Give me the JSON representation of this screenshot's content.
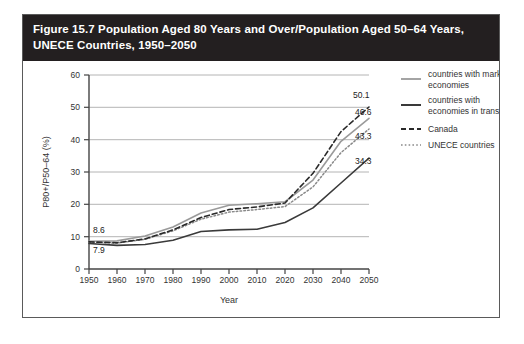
{
  "figure": {
    "title_line1": "Figure 15.7 Population Aged 80 Years and Over/Population Aged 50–64 Years,",
    "title_line2": "UNECE Countries, 1950–2050",
    "title_bg": "#231f20",
    "title_color": "#ffffff",
    "border_color": "#5a5a5a"
  },
  "chart_data": {
    "type": "line",
    "title": "Figure 15.7 Population Aged 80 Years and Over/Population Aged 50–64 Years, UNECE Countries, 1950–2050",
    "xlabel": "Year",
    "ylabel": "P80+/P50–64 (%)",
    "x": [
      1950,
      1960,
      1970,
      1980,
      1990,
      2000,
      2010,
      2020,
      2030,
      2040,
      2050
    ],
    "xlim": [
      1950,
      2050
    ],
    "ylim": [
      0,
      60
    ],
    "xticks": [
      "1950",
      "1960",
      "1970",
      "1980",
      "1990",
      "2000",
      "2010",
      "2020",
      "2030",
      "2040",
      "2050"
    ],
    "yticks": [
      "0",
      "10",
      "20",
      "30",
      "40",
      "50",
      "60"
    ],
    "grid": "horizontal",
    "legend_position": "right",
    "series": [
      {
        "name": "countries with market economies",
        "key": "market",
        "style": "solid",
        "color": "#9a9a9a",
        "width": 1.6,
        "values": [
          8.6,
          8.7,
          10.2,
          13.0,
          17.3,
          19.7,
          20.2,
          20.8,
          27.5,
          39.5,
          46.6
        ],
        "start_label": "8.6",
        "end_label": "46.6"
      },
      {
        "name": "countries with economies in translation",
        "key": "transition",
        "style": "solid",
        "color": "#3a3a3a",
        "width": 1.6,
        "values": [
          7.9,
          7.3,
          7.6,
          8.9,
          11.6,
          12.1,
          12.3,
          14.4,
          18.9,
          26.6,
          34.3
        ],
        "start_label": "7.9",
        "end_label": "34.3"
      },
      {
        "name": "Canada",
        "key": "canada",
        "style": "dashed",
        "color": "#2a2a2a",
        "width": 1.6,
        "values": [
          8.4,
          8.1,
          9.3,
          12.1,
          15.9,
          18.4,
          19.2,
          20.4,
          29.6,
          42.5,
          50.1
        ],
        "end_label": "50.1"
      },
      {
        "name": "UNECE countries",
        "key": "unece",
        "style": "dotted",
        "color": "#8a8a8a",
        "width": 1.5,
        "values": [
          8.3,
          8.0,
          9.2,
          11.8,
          15.4,
          17.6,
          18.4,
          19.3,
          25.4,
          36.0,
          43.3
        ],
        "end_label": "43.3"
      }
    ],
    "annotations": [
      {
        "text": "8.6",
        "series": "market",
        "at": 1950
      },
      {
        "text": "7.9",
        "series": "transition",
        "at": 1950
      },
      {
        "text": "50.1",
        "series": "canada",
        "at": 2050
      },
      {
        "text": "46.6",
        "series": "market",
        "at": 2050
      },
      {
        "text": "43.3",
        "series": "unece",
        "at": 2050
      },
      {
        "text": "34.3",
        "series": "transition",
        "at": 2050
      }
    ]
  }
}
